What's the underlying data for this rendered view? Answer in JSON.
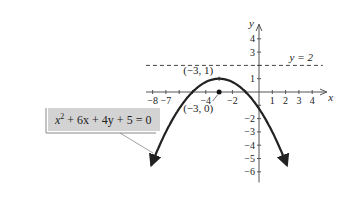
{
  "chart_data": {
    "type": "line",
    "title": "",
    "xlabel": "x",
    "ylabel": "y",
    "xlim": [
      -8.5,
      5
    ],
    "ylim": [
      -6.8,
      5
    ],
    "x_ticks": [
      -8,
      -7,
      -6,
      -5,
      -4,
      -3,
      -2,
      -1,
      1,
      2,
      3,
      4
    ],
    "x_tick_labels": [
      {
        "value": -8,
        "label": "−8"
      },
      {
        "value": -7,
        "label": "−7"
      },
      {
        "value": -4,
        "label": "−4"
      },
      {
        "value": -2,
        "label": "−2"
      },
      {
        "value": 1,
        "label": "1"
      },
      {
        "value": 2,
        "label": "2"
      },
      {
        "value": 3,
        "label": "3"
      },
      {
        "value": 4,
        "label": "4"
      }
    ],
    "y_ticks": [
      -6,
      -5,
      -4,
      -3,
      -2,
      -1,
      1,
      2,
      3,
      4
    ],
    "y_tick_labels": [
      {
        "value": 4,
        "label": "4"
      },
      {
        "value": 3,
        "label": "3"
      },
      {
        "value": 1,
        "label": "1"
      },
      {
        "value": -2,
        "label": "−2"
      },
      {
        "value": -3,
        "label": "−3"
      },
      {
        "value": -4,
        "label": "−4"
      },
      {
        "value": -5,
        "label": "−5"
      },
      {
        "value": -6,
        "label": "−6"
      }
    ],
    "series": [
      {
        "name": "parabola",
        "equation": "x^2 + 6x + 4y + 5 = 0",
        "function": "y = -(x^2 + 6x + 5)/4",
        "x_range": [
          -8.1,
          2.1
        ]
      }
    ],
    "directrix": {
      "label": "y = 2",
      "value": 2
    },
    "vertex": {
      "x": -3,
      "y": 1,
      "label": "(−3, 1)"
    },
    "focus": {
      "x": -3,
      "y": 0,
      "label": "(−3, 0)"
    },
    "equation_label": {
      "base": "x",
      "exp": "2",
      "rest": " + 6x + 4y + 5 = 0"
    },
    "grid": false
  }
}
